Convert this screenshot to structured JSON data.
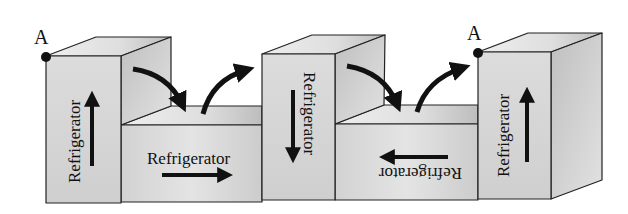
{
  "diagram": {
    "point_label_left": "A",
    "point_label_right": "A",
    "boxes": [
      {
        "id": "tall-1",
        "label": "Refrigerator",
        "orientation": "vertical-up",
        "arrow": "up"
      },
      {
        "id": "low-1",
        "label": "Refrigerator",
        "orientation": "horizontal",
        "arrow": "right"
      },
      {
        "id": "tall-2",
        "label": "Refrigerator",
        "orientation": "vertical-down",
        "arrow": "down"
      },
      {
        "id": "low-2",
        "label": "Refrigerator",
        "orientation": "upside-down",
        "arrow": "left"
      },
      {
        "id": "tall-3",
        "label": "Refrigerator",
        "orientation": "vertical-up",
        "arrow": "up"
      }
    ],
    "transfer_arrows": [
      {
        "from": "tall-1",
        "to": "low-1",
        "direction": "down"
      },
      {
        "from": "low-1",
        "to": "tall-2",
        "direction": "up"
      },
      {
        "from": "tall-2",
        "to": "low-2",
        "direction": "down"
      },
      {
        "from": "low-2",
        "to": "tall-3",
        "direction": "up"
      }
    ],
    "colors": {
      "line": "#222222",
      "front_face": "#d9d9d9",
      "top_face": "#e6e6e6",
      "side_face": "#c4c4c4",
      "arrow": "#111111"
    }
  }
}
